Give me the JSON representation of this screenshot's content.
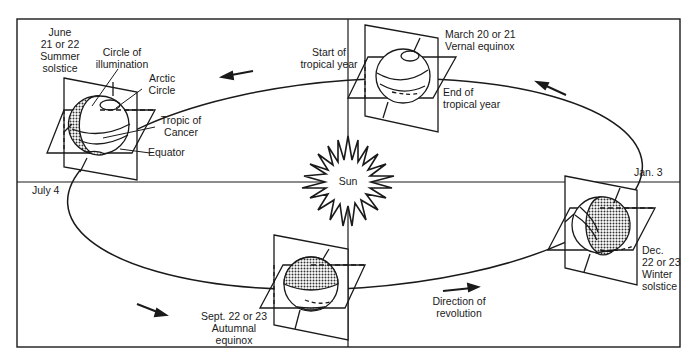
{
  "diagram": {
    "sun_label": "Sun",
    "positions": {
      "summer_solstice": {
        "date": "June",
        "date2": "21 or 22",
        "event": "Summer",
        "event2": "solstice"
      },
      "vernal_equinox": {
        "date": "March 20 or 21",
        "event": "Vernal equinox"
      },
      "winter_solstice": {
        "date": "Dec.",
        "date2": "22 or 23",
        "event": "Winter",
        "event2": "solstice"
      },
      "autumnal_equinox": {
        "date": "Sept. 22 or 23",
        "event": "Autumnal",
        "event2": "equinox"
      }
    },
    "labels": {
      "circle_of_illumination_1": "Circle of",
      "circle_of_illumination_2": "illumination",
      "arctic_circle_1": "Arctic",
      "arctic_circle_2": "Circle",
      "tropic_of_cancer_1": "Tropic of",
      "tropic_of_cancer_2": "Cancer",
      "equator": "Equator",
      "start_tropical_year_1": "Start of",
      "start_tropical_year_2": "tropical year",
      "end_tropical_year_1": "End of",
      "end_tropical_year_2": "tropical year",
      "aphelion": "July 4",
      "perihelion": "Jan. 3",
      "direction_1": "Direction of",
      "direction_2": "revolution"
    },
    "colors": {
      "line": "#1a1a1a",
      "background": "#ffffff",
      "shade": "#555555"
    }
  }
}
